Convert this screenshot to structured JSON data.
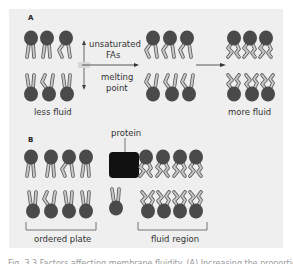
{
  "figure": {
    "panel_a": {
      "letter": "A",
      "left_label": "less fluid",
      "right_label": "more fluid",
      "axis_up_label_line1": "unsaturated",
      "axis_up_label_line2": "FAs",
      "axis_down_label_line1": "melting",
      "axis_down_label_line2": "point"
    },
    "panel_b": {
      "letter": "B",
      "protein_label": "protein",
      "left_bracket_label": "ordered plate",
      "right_bracket_label": "fluid region"
    },
    "caption": "Fig. 3.3 Factors affecting membrane fluidity. (A) Increasing the proportion..."
  },
  "colors": {
    "panel_bg": "#efefef",
    "lipid_head": "#4a4a4a",
    "lipid_tail_fill": "#c8c8c8",
    "lipid_tail_stroke": "#555555",
    "protein": "#111111"
  }
}
